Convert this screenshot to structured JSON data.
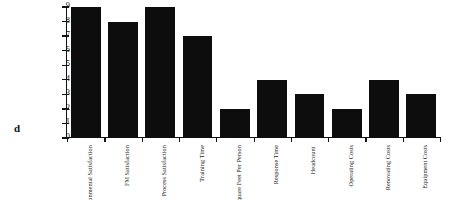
{
  "figure": {
    "panel_letter": "d"
  },
  "chart_data": {
    "type": "bar",
    "title": "",
    "subtitle": "",
    "xlabel": "",
    "ylabel": "",
    "ylim": [
      0,
      9
    ],
    "grid": false,
    "legend": "none",
    "orientation": "vertical",
    "bar_color": "#0d0d0d",
    "axis_color": "#121212",
    "background_color": "#ffffff",
    "y_ticks": [
      "0",
      "1",
      "2",
      "3",
      "4",
      "5",
      "6",
      "7",
      "8",
      "9"
    ],
    "categories": [
      "Environmental Satisfaction",
      "FM Satisfaction",
      "Process Satisfaction",
      "Training Time",
      "Square Feet Per Person",
      "Response Time",
      "Headcount",
      "Operating Costs",
      "Renovating Costs",
      "Equipment Costs"
    ],
    "category_lines": [
      [
        "Environmental",
        "Satisfaction"
      ],
      [
        "FM",
        "Satisfaction"
      ],
      [
        "Process",
        "Satisfaction"
      ],
      [
        "Training",
        "Time"
      ],
      [
        "Square Feet",
        "Per Person"
      ],
      [
        "Response",
        "Time"
      ],
      [
        "Headcount",
        ""
      ],
      [
        "Operating",
        "Costs"
      ],
      [
        "Renovating",
        "Costs"
      ],
      [
        "Equipment",
        "Costs"
      ]
    ],
    "values": [
      9,
      8,
      9,
      7,
      2,
      4,
      3,
      2,
      4,
      3
    ]
  }
}
